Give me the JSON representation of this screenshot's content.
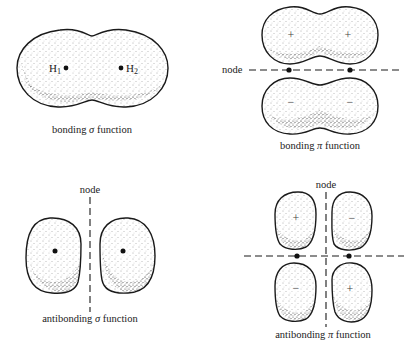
{
  "figure": {
    "panels": [
      {
        "id": "bonding-sigma",
        "caption_prefix": "bonding ",
        "caption_symbol": "σ",
        "caption_suffix": " function",
        "nuclei": [
          {
            "label": "H",
            "sub": "1"
          },
          {
            "label": "H",
            "sub": "2"
          }
        ]
      },
      {
        "id": "bonding-pi",
        "caption_prefix": "bonding ",
        "caption_symbol": "π",
        "caption_suffix": " function",
        "node_label": "node",
        "signs": [
          "+",
          "+",
          "−",
          "−"
        ]
      },
      {
        "id": "antibonding-sigma",
        "caption_prefix": "antibonding ",
        "caption_symbol": "σ",
        "caption_suffix": " function",
        "node_label": "node"
      },
      {
        "id": "antibonding-pi",
        "caption_prefix": "antibonding ",
        "caption_symbol": "π",
        "caption_suffix": " function",
        "node_label": "node",
        "signs": [
          "+",
          "−",
          "−",
          "+"
        ]
      }
    ]
  }
}
